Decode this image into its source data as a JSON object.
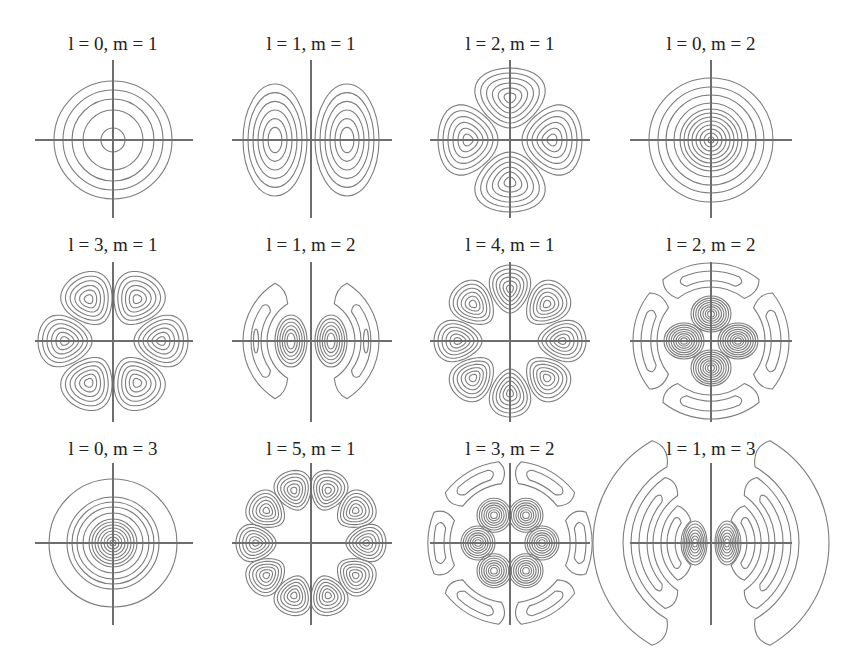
{
  "figure": {
    "width": 852,
    "height": 650,
    "background": "#ffffff",
    "line_color": "#7d7d7d",
    "axis_color": "#6e6e6e",
    "text_color": "#222222"
  },
  "chart_data": {
    "type": "heatmap",
    "subtype": "contour-grid",
    "title": "",
    "layout": {
      "rows": 3,
      "cols": 4
    },
    "panels": [
      {
        "row": 0,
        "col": 0,
        "label": "l = 0, m = 1",
        "l": 0,
        "m": 1,
        "cx": 113,
        "cy": 140,
        "title_y": 50,
        "vy": [
          60,
          218
        ],
        "hx": [
          35,
          193
        ],
        "shape": "rings",
        "rings": [
          12,
          30,
          41,
          50,
          59
        ]
      },
      {
        "row": 0,
        "col": 1,
        "label": "l = 1, m = 1",
        "l": 1,
        "m": 1,
        "cx": 311,
        "cy": 140,
        "title_y": 50,
        "vy": [
          60,
          218
        ],
        "hx": [
          232,
          392
        ],
        "shape": "lobes",
        "lobes": 2,
        "lobe_r": 36,
        "lobe_rx": 30,
        "lobe_ry": 52,
        "levels": 6,
        "rot": 0
      },
      {
        "row": 0,
        "col": 2,
        "label": "l = 2, m = 1",
        "l": 2,
        "m": 1,
        "cx": 510,
        "cy": 140,
        "title_y": 50,
        "vy": [
          60,
          218
        ],
        "hx": [
          430,
          590
        ],
        "shape": "lobes",
        "lobes": 4,
        "lobe_r": 42,
        "lobe_rx": 34,
        "lobe_ry": 30,
        "levels": 6,
        "rot": 0
      },
      {
        "row": 0,
        "col": 3,
        "label": "l = 0, m = 2",
        "l": 0,
        "m": 2,
        "cx": 711,
        "cy": 140,
        "title_y": 50,
        "vy": [
          60,
          218
        ],
        "hx": [
          630,
          792
        ],
        "shape": "rings",
        "rings": [
          3,
          7,
          11,
          15,
          19,
          23,
          27,
          31,
          37,
          45,
          53,
          62
        ]
      },
      {
        "row": 1,
        "col": 0,
        "label": "l = 3, m = 1",
        "l": 3,
        "m": 1,
        "cx": 113,
        "cy": 341,
        "title_y": 251,
        "vy": [
          262,
          422
        ],
        "hx": [
          35,
          193
        ],
        "shape": "lobes",
        "lobes": 6,
        "lobe_r": 48,
        "lobe_rx": 25,
        "lobe_ry": 27,
        "levels": 6,
        "rot": 0
      },
      {
        "row": 1,
        "col": 1,
        "label": "l = 1, m = 2",
        "l": 1,
        "m": 2,
        "cx": 311,
        "cy": 341,
        "title_y": 251,
        "vy": [
          262,
          422
        ],
        "hx": [
          232,
          392
        ],
        "shape": "l1m2"
      },
      {
        "row": 1,
        "col": 2,
        "label": "l = 4, m = 1",
        "l": 4,
        "m": 1,
        "cx": 510,
        "cy": 341,
        "title_y": 251,
        "vy": [
          262,
          422
        ],
        "hx": [
          430,
          590
        ],
        "shape": "lobes",
        "lobes": 8,
        "lobe_r": 52,
        "lobe_rx": 20,
        "lobe_ry": 24,
        "levels": 6,
        "rot": 0
      },
      {
        "row": 1,
        "col": 3,
        "label": "l = 2, m = 2",
        "l": 2,
        "m": 2,
        "cx": 711,
        "cy": 341,
        "title_y": 251,
        "vy": [
          262,
          422
        ],
        "hx": [
          630,
          792
        ],
        "shape": "l2m2"
      },
      {
        "row": 2,
        "col": 0,
        "label": "l = 0, m = 3",
        "l": 0,
        "m": 3,
        "cx": 113,
        "cy": 543,
        "title_y": 455,
        "vy": [
          463,
          625
        ],
        "hx": [
          35,
          193
        ],
        "shape": "rings",
        "rings": [
          3,
          6,
          9,
          12,
          15,
          18,
          21,
          24,
          30,
          36,
          41,
          46,
          64
        ]
      },
      {
        "row": 2,
        "col": 1,
        "label": "l = 5, m = 1",
        "l": 5,
        "m": 1,
        "cx": 311,
        "cy": 543,
        "title_y": 455,
        "vy": [
          463,
          625
        ],
        "hx": [
          232,
          392
        ],
        "shape": "lobes",
        "lobes": 10,
        "lobe_r": 55,
        "lobe_rx": 18,
        "lobe_ry": 20,
        "levels": 6,
        "rot": 0
      },
      {
        "row": 2,
        "col": 2,
        "label": "l = 3, m = 2",
        "l": 3,
        "m": 2,
        "cx": 510,
        "cy": 543,
        "title_y": 455,
        "vy": [
          463,
          625
        ],
        "hx": [
          430,
          590
        ],
        "shape": "l3m2"
      },
      {
        "row": 2,
        "col": 3,
        "label": "l = 1, m = 3",
        "l": 1,
        "m": 3,
        "cx": 711,
        "cy": 543,
        "title_y": 455,
        "vy": [
          463,
          625
        ],
        "hx": [
          630,
          792
        ],
        "shape": "l1m3"
      }
    ],
    "xlabel": "",
    "ylabel": "",
    "grid": false,
    "legend": null
  }
}
